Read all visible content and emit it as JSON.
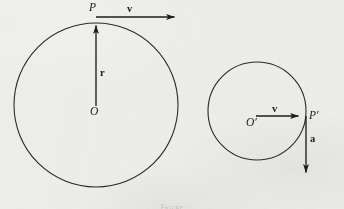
{
  "figure": {
    "background_color": "#f2f2f0",
    "ink_color": "#1d1d1d",
    "caption": "Figure",
    "left_diagram": {
      "circle": {
        "cx": 96,
        "cy": 105,
        "r": 82
      },
      "center_label": "O",
      "point_label": "P",
      "radius_vector_label": "r",
      "velocity_vector_label": "v"
    },
    "right_diagram": {
      "circle": {
        "cx": 257,
        "cy": 111,
        "r": 49
      },
      "center_label": "O′",
      "point_label": "P′",
      "velocity_vector_label": "v",
      "acceleration_vector_label": "a"
    }
  }
}
